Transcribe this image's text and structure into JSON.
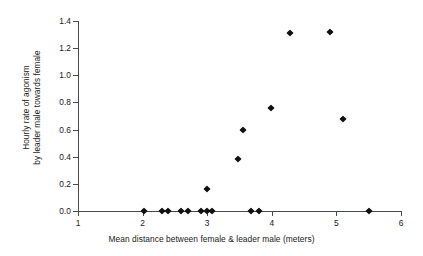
{
  "chart_data": {
    "type": "scatter",
    "title": "",
    "xlabel": "Mean distance between female & leader male (meters)",
    "ylabel": "Hourly rate of agonism by leader male towards female",
    "ylabel_lines": [
      "Hourly rate of agonism",
      "by leader male towards female"
    ],
    "xlim": [
      1,
      6
    ],
    "ylim": [
      0.0,
      1.4
    ],
    "xticks": [
      1,
      2,
      3,
      4,
      5,
      6
    ],
    "xtick_labels": [
      "1",
      "2",
      "3",
      "4",
      "5",
      "6"
    ],
    "yticks": [
      0.0,
      0.2,
      0.4,
      0.6,
      0.8,
      1.0,
      1.2,
      1.4
    ],
    "ytick_labels": [
      "0.0",
      "0.2",
      "0.4",
      "0.6",
      "0.8",
      "1.0",
      "1.2",
      "1.4"
    ],
    "grid": false,
    "legend": null,
    "marker": "diamond",
    "marker_color": "#111111",
    "points": [
      {
        "x": 2.02,
        "y": 0.0
      },
      {
        "x": 2.3,
        "y": 0.0
      },
      {
        "x": 2.4,
        "y": 0.0
      },
      {
        "x": 2.6,
        "y": 0.0
      },
      {
        "x": 2.7,
        "y": 0.0
      },
      {
        "x": 2.9,
        "y": 0.0
      },
      {
        "x": 3.0,
        "y": 0.0
      },
      {
        "x": 3.08,
        "y": 0.0
      },
      {
        "x": 3.68,
        "y": 0.0
      },
      {
        "x": 3.8,
        "y": 0.0
      },
      {
        "x": 5.5,
        "y": 0.0
      },
      {
        "x": 3.0,
        "y": 0.16
      },
      {
        "x": 3.48,
        "y": 0.385
      },
      {
        "x": 3.55,
        "y": 0.595
      },
      {
        "x": 3.98,
        "y": 0.76
      },
      {
        "x": 5.1,
        "y": 0.675
      },
      {
        "x": 4.28,
        "y": 1.31
      },
      {
        "x": 4.9,
        "y": 1.32
      }
    ]
  },
  "colors": {
    "marker": "#111111",
    "axis": "#4a4a4a",
    "text": "#1a1a1a",
    "background": "#ffffff"
  }
}
